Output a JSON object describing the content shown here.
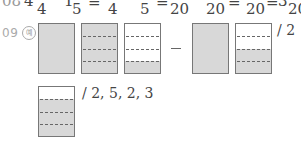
{
  "top_line": {
    "text_fragments": [
      "08",
      "4",
      "4",
      "1",
      "5",
      "=",
      "4",
      "5",
      "=",
      "20",
      "20",
      "=",
      "20",
      "=",
      "3",
      "20"
    ],
    "visible_denominators": [
      "4",
      "5",
      "4",
      "5",
      "20",
      "20",
      "20",
      "20"
    ]
  },
  "question": {
    "number": "09",
    "example_marker": "예"
  },
  "row1": {
    "boxes": [
      {
        "id": 1,
        "divisions": 4,
        "shaded_rows": [
          1,
          2,
          3,
          4
        ]
      },
      {
        "id": 2,
        "divisions": 4,
        "shaded_rows": [
          1,
          2,
          3,
          4
        ]
      },
      {
        "id": 3,
        "divisions": 4,
        "shaded_rows": [
          4
        ]
      },
      {
        "id": 4,
        "divisions": 4,
        "shaded_rows": [
          1,
          2,
          3,
          4
        ]
      },
      {
        "id": 5,
        "divisions": 4,
        "shaded_rows": [
          2,
          3,
          4
        ]
      }
    ],
    "operator": "−",
    "answer": "/ 2"
  },
  "row2": {
    "boxes": [
      {
        "id": 6,
        "divisions": 4,
        "shaded_rows": [
          2,
          3,
          4
        ]
      }
    ],
    "answer": "/ 2, 5, 2, 3"
  },
  "colors": {
    "shade": "#d8d8d8",
    "border": "#777777",
    "dash": "#666666"
  }
}
